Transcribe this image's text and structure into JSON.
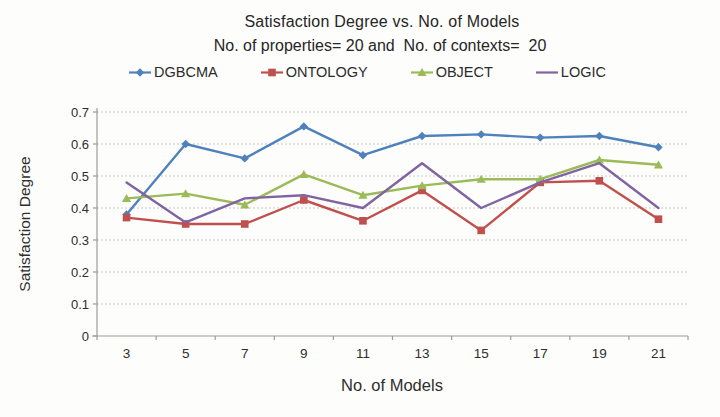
{
  "chart_data": {
    "type": "line",
    "title": "Satisfaction Degree vs. No. of Models",
    "subtitle": "No. of properties= 20 and  No. of contexts=  20",
    "xlabel": "No. of Models",
    "ylabel": "Satisfaction Degree",
    "x": [
      3,
      5,
      7,
      9,
      11,
      13,
      15,
      17,
      19,
      21
    ],
    "ylim": [
      0,
      0.7
    ],
    "ytick_step": 0.1,
    "ytick_labels": [
      "0",
      "0.1",
      "0.2",
      "0.3",
      "0.4",
      "0.5",
      "0.6",
      "0.7"
    ],
    "grid": true,
    "legend_position": "top",
    "series": [
      {
        "name": "DGBCMA",
        "color": "#4F81BD",
        "marker": "diamond",
        "values": [
          0.38,
          0.6,
          0.555,
          0.655,
          0.565,
          0.625,
          0.63,
          0.62,
          0.625,
          0.59
        ]
      },
      {
        "name": "ONTOLOGY",
        "color": "#C0504D",
        "marker": "square",
        "values": [
          0.37,
          0.35,
          0.35,
          0.425,
          0.36,
          0.455,
          0.33,
          0.48,
          0.485,
          0.365
        ]
      },
      {
        "name": "OBJECT",
        "color": "#9BBB59",
        "marker": "triangle",
        "values": [
          0.43,
          0.445,
          0.41,
          0.505,
          0.44,
          0.47,
          0.49,
          0.49,
          0.55,
          0.535
        ]
      },
      {
        "name": "LOGIC",
        "color": "#8064A2",
        "marker": "none",
        "values": [
          0.48,
          0.355,
          0.43,
          0.44,
          0.4,
          0.54,
          0.4,
          0.48,
          0.54,
          0.4
        ]
      }
    ],
    "colors": {
      "grid": "#c9c9c3",
      "axis": "#9b9b96",
      "text": "#2e2e2e"
    }
  }
}
